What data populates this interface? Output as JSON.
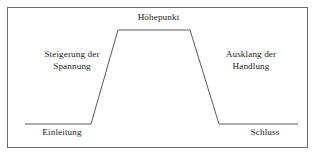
{
  "figure": {
    "border_color": "#6f6f6f",
    "line_color": "#5a5a5a",
    "text_color": "#1c1c1c",
    "background": "#ffffff"
  },
  "labels": {
    "hoehepunkt": "Höhepunkt",
    "steigerung": "Steigerung der\nSpannung",
    "ausklang": "Ausklang der\nHandlung",
    "einleitung": "Einleitung",
    "schluss": "Schluss"
  },
  "chart_data": {
    "type": "line",
    "xlabel": "",
    "ylabel": "",
    "grid": false,
    "legend": null,
    "xlim": [
      0,
      317
    ],
    "ylim": [
      0,
      158
    ],
    "series": [
      {
        "name": "Spannungsverlauf",
        "points": [
          {
            "x": 25,
            "y": 124
          },
          {
            "x": 91,
            "y": 124
          },
          {
            "x": 118,
            "y": 30
          },
          {
            "x": 190,
            "y": 30
          },
          {
            "x": 219,
            "y": 124
          },
          {
            "x": 298,
            "y": 124
          }
        ]
      }
    ],
    "annotations": [
      {
        "text": "Höhepunkt",
        "x": 154,
        "y": 18,
        "anchor": "center"
      },
      {
        "text": "Steigerung der Spannung",
        "x": 72,
        "y": 60,
        "anchor": "center"
      },
      {
        "text": "Ausklang der Handlung",
        "x": 251,
        "y": 60,
        "anchor": "center"
      },
      {
        "text": "Einleitung",
        "x": 62,
        "y": 133,
        "anchor": "center"
      },
      {
        "text": "Schluss",
        "x": 265,
        "y": 133,
        "anchor": "center"
      }
    ]
  }
}
